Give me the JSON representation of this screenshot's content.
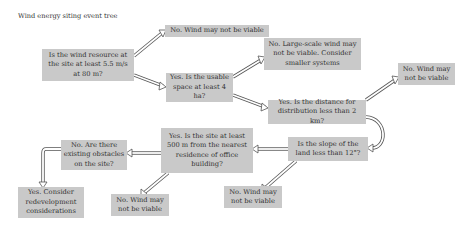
{
  "title": "Wind energy siting event tree",
  "nodes": {
    "q_wind_resource": "Is the wind resource at the site at least 5.5 m/s at 80 m?",
    "no_wind_1": "No. Wind may not be viable",
    "q_space": "Yes. Is the usable space at least 4 ha?",
    "no_large_scale": "No. Large-scale wind may not be viable. Consider smaller systems",
    "q_distance": "Yes. Is the distance for distribution less than 2 km?",
    "no_wind_2": "No. Wind may not be viable",
    "q_slope": "Is the slope of the land less than 12°?",
    "no_wind_3": "No. Wind may not be viable",
    "q_residence": "Yes. Is the site at least 500 m from the nearest residence of office building?",
    "no_wind_4": "No. Wind may not be viable",
    "q_obstacles": "No. Are there existing obstacles on the site?",
    "yes_redevelopment": "Yes. Consider redevelopment considerations"
  },
  "colors": {
    "box_fill": "#c9c9c9",
    "arrow_stroke": "#555555"
  }
}
